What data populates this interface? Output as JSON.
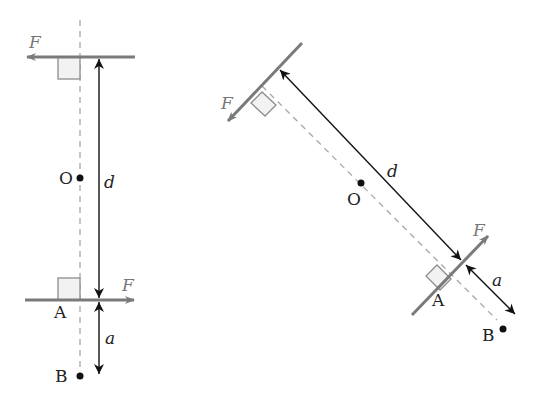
{
  "diagram": {
    "colors": {
      "force": "#7a7a7a",
      "dimension": "#111111",
      "dashed": "#a8a8a8",
      "right_angle": "#8c8c8c",
      "right_angle_fill": "#f2f2f2"
    },
    "left_figure": {
      "force_top_label": "F",
      "force_bottom_label": "F",
      "point_o_label": "O",
      "point_a_label": "A",
      "point_b_label": "B",
      "distance_d_label": "d",
      "distance_a_label": "a"
    },
    "right_figure": {
      "force_top_label": "F",
      "force_bottom_label": "F",
      "point_o_label": "O",
      "point_a_label": "A",
      "point_b_label": "B",
      "distance_d_label": "d",
      "distance_a_label": "a"
    }
  }
}
